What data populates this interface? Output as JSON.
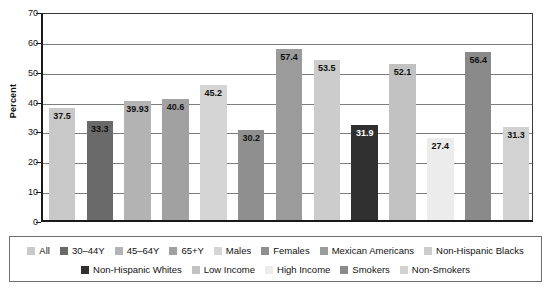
{
  "chart_data": {
    "type": "bar",
    "title": "",
    "xlabel": "",
    "ylabel": "Percent",
    "ylim": [
      0,
      70
    ],
    "yticks": [
      0,
      10,
      20,
      30,
      40,
      50,
      60,
      70
    ],
    "ytick_labels": [
      "0",
      "10",
      "20",
      "30",
      "40",
      "50",
      "60",
      "70"
    ],
    "grid": true,
    "legend_position": "bottom",
    "categories": [
      "All",
      "30–44Y",
      "45–64Y",
      "65+Y",
      "Males",
      "Females",
      "Mexican Americans",
      "Non-Hispanic Blacks",
      "Non-Hispanic Whites",
      "Low Income",
      "High Income",
      "Smokers",
      "Non-Smokers"
    ],
    "values": [
      37.5,
      33.3,
      39.93,
      40.6,
      45.2,
      30.2,
      57.4,
      53.5,
      31.9,
      52.1,
      27.4,
      56.4,
      31.3
    ],
    "value_labels": [
      "37.5",
      "33.3",
      "39.93",
      "40.6",
      "45.2",
      "30.2",
      "57.4",
      "53.5",
      "31.9",
      "52.1",
      "27.4",
      "56.4",
      "31.3"
    ],
    "bar_colors": [
      "#c9c9c9",
      "#6a6a6a",
      "#b3b3b3",
      "#a1a1a1",
      "#d5d5d5",
      "#8f8f8f",
      "#9b9b9b",
      "#cccccc",
      "#303030",
      "#c2c2c2",
      "#ececec",
      "#8a8a8a",
      "#d2d2d2"
    ],
    "label_text_colors": [
      "#111111",
      "#111111",
      "#111111",
      "#111111",
      "#111111",
      "#111111",
      "#111111",
      "#111111",
      "#ffffff",
      "#111111",
      "#111111",
      "#111111",
      "#111111"
    ]
  },
  "legend": {
    "rows": [
      [
        {
          "label": "All",
          "color": "#c9c9c9"
        },
        {
          "label": "30–44Y",
          "color": "#6a6a6a"
        },
        {
          "label": "45–64Y",
          "color": "#b3b3b3"
        },
        {
          "label": "65+Y",
          "color": "#a1a1a1"
        },
        {
          "label": "Males",
          "color": "#d5d5d5"
        },
        {
          "label": "Females",
          "color": "#8f8f8f"
        },
        {
          "label": "Mexican Americans",
          "color": "#9b9b9b"
        },
        {
          "label": "Non-Hispanic Blacks",
          "color": "#cccccc"
        }
      ],
      [
        {
          "label": "Non-Hispanic Whites",
          "color": "#303030"
        },
        {
          "label": "Low Income",
          "color": "#c2c2c2"
        },
        {
          "label": "High Income",
          "color": "#ececec"
        },
        {
          "label": "Smokers",
          "color": "#8a8a8a"
        },
        {
          "label": "Non-Smokers",
          "color": "#d2d2d2"
        }
      ]
    ]
  },
  "axis": {
    "y_title": "Percent"
  }
}
